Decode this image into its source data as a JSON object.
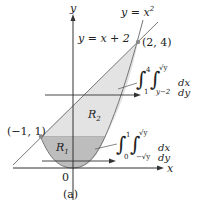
{
  "figure": {
    "caption": "(a)",
    "axes": {
      "x_label": "x",
      "y_label": "y",
      "origin_label": "0"
    },
    "curves": [
      {
        "name": "parabola",
        "label": "y = x²",
        "label_base": "y = x",
        "label_exp": "2"
      },
      {
        "name": "line",
        "label": "y = x + 2"
      }
    ],
    "points": [
      {
        "label": "(2, 4)",
        "x": 2,
        "y": 4
      },
      {
        "label": "(−1, 1)",
        "x": -1,
        "y": 1
      }
    ],
    "regions": [
      {
        "label": "R",
        "sub": "1"
      },
      {
        "label": "R",
        "sub": "2"
      }
    ],
    "integrals": [
      {
        "region": "R2",
        "outer_lower": "1",
        "outer_upper": "4",
        "inner_lower": "y−2",
        "inner_upper": "√y",
        "differential": "dx dy"
      },
      {
        "region": "R1",
        "outer_lower": "0",
        "outer_upper": "1",
        "inner_lower": "−√y",
        "inner_upper": "√y",
        "differential": "dx dy"
      }
    ],
    "colors": {
      "r1_fill": "#bdbdbd",
      "r2_fill": "#e3e3e3",
      "line": "#777777",
      "axis": "#333333",
      "point": "#8a8a8a"
    }
  }
}
